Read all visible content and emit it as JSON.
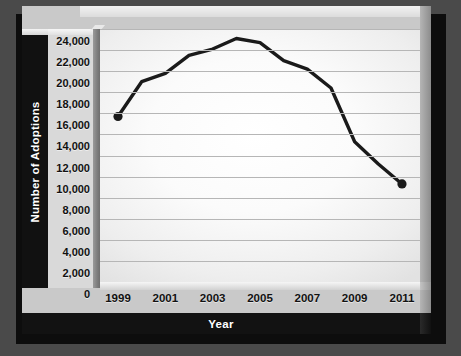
{
  "chart_data": {
    "type": "line",
    "title": "",
    "xlabel": "Year",
    "ylabel": "Number of Adoptions",
    "x": [
      1999,
      2000,
      2001,
      2002,
      2003,
      2004,
      2005,
      2006,
      2007,
      2008,
      2009,
      2010,
      2011
    ],
    "values": [
      15700,
      19000,
      19800,
      21500,
      22100,
      23100,
      22700,
      21000,
      20200,
      18400,
      13300,
      11200,
      9300
    ],
    "series": [
      {
        "name": "Number of Adoptions",
        "values": [
          15700,
          19000,
          19800,
          21500,
          22100,
          23100,
          22700,
          21000,
          20200,
          18400,
          13300,
          11200,
          9300
        ]
      }
    ],
    "xlim": [
      1999,
      2011
    ],
    "ylim": [
      0,
      24000
    ],
    "y_ticks": [
      0,
      2000,
      4000,
      6000,
      8000,
      10000,
      12000,
      14000,
      16000,
      18000,
      20000,
      22000,
      24000
    ],
    "y_tick_labels": [
      "0",
      "2,000",
      "4,000",
      "6,000",
      "8,000",
      "10,000",
      "12,000",
      "14,000",
      "16,000",
      "18,000",
      "20,000",
      "22,000",
      "24,000"
    ],
    "x_ticks": [
      1999,
      2001,
      2003,
      2005,
      2007,
      2009,
      2011
    ],
    "x_tick_labels": [
      "1999",
      "2001",
      "2003",
      "2005",
      "2007",
      "2009",
      "2011"
    ],
    "grid": "horizontal",
    "legend": "none",
    "markers_shown_at": [
      1999,
      2011
    ],
    "line_color": "#1a1a1a",
    "marker_color": "#1a1a1a",
    "plot_background": "#ffffff",
    "panel_background": "#c9c9c9",
    "axis_band_color": "#111111",
    "axis_band_text_color": "#ffffff",
    "grid_color": "#b6b6b6",
    "page_background": "#4a4a4a"
  }
}
